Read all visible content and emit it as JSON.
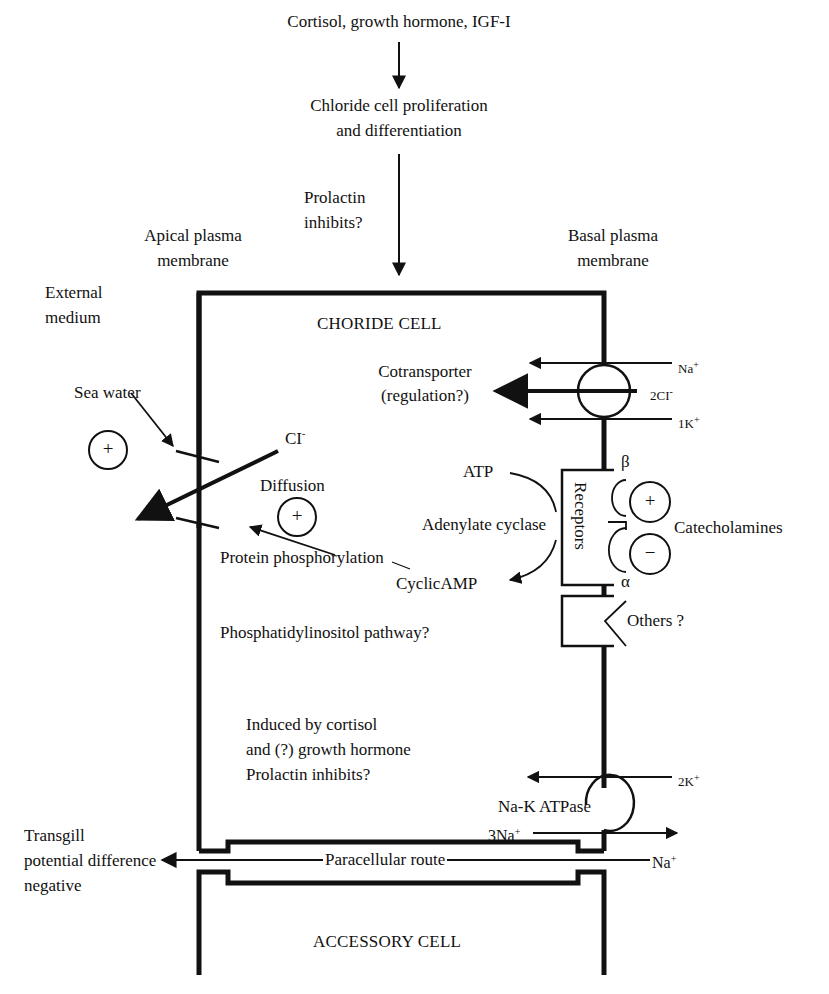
{
  "top": {
    "hormones": "Cortisol, growth hormone, IGF-I",
    "proliferation_line1": "Chloride cell proliferation",
    "proliferation_line2": "and differentiation",
    "prolactin_line1": "Prolactin",
    "prolactin_line2": "inhibits?"
  },
  "membranes": {
    "apical_line1": "Apical plasma",
    "apical_line2": "membrane",
    "basal_line1": "Basal plasma",
    "basal_line2": "membrane"
  },
  "external": {
    "medium_line1": "External",
    "medium_line2": "medium",
    "sea_water": "Sea water",
    "plus_symbol": "+"
  },
  "chloride_cell": {
    "title": "CHORIDE CELL",
    "cl_ion": "CI",
    "cl_charge": "-",
    "diffusion": "Diffusion",
    "diffusion_plus": "+",
    "protein_phosphorylation": "Protein phosphorylation",
    "cyclic_amp": "CyclicAMP",
    "phosphatidylinositol": "Phosphatidylinositol pathway?",
    "induced_line1": "Induced by cortisol",
    "induced_line2": "and (?) growth hormone",
    "induced_line3": "Prolactin inhibits?"
  },
  "cotransporter": {
    "label_line1": "Cotransporter",
    "label_line2": "(regulation?)",
    "ions": [
      {
        "base": "Na",
        "charge": "+"
      },
      {
        "base": "2CI",
        "charge": "-"
      },
      {
        "base": "1K",
        "charge": "+"
      }
    ]
  },
  "receptors": {
    "atp": "ATP",
    "adenylate_cyclase": "Adenylate cyclase",
    "receptors_label": "Receptors",
    "beta": "β",
    "alpha": "α",
    "catecholamines": "Catecholamines",
    "plus": "+",
    "minus": "−",
    "others": "Others ?"
  },
  "na_k_atpase": {
    "label": "Na-K ATPase",
    "k_ion": {
      "base": "2K",
      "charge": "+"
    },
    "na_ion": {
      "base": "3Na",
      "charge": "+"
    }
  },
  "paracellular": {
    "transgill_line1": "Transgill",
    "transgill_line2": "potential difference",
    "transgill_line3": "negative",
    "route": "Paracellular route",
    "na_ion": {
      "base": "Na",
      "charge": "+"
    }
  },
  "accessory_cell": {
    "title": "ACCESSORY CELL"
  }
}
